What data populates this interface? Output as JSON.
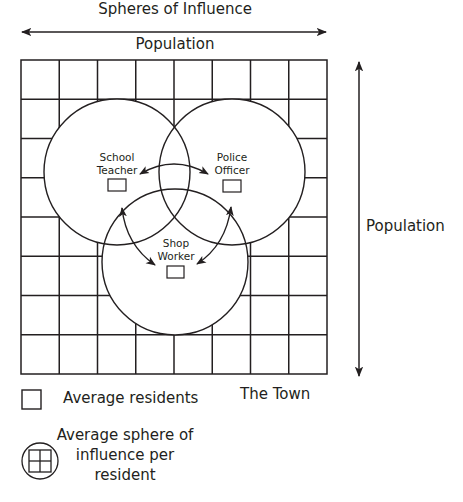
{
  "title": "Spheres of Influence",
  "axes": {
    "horizontal_label": "Population",
    "vertical_label": "Population"
  },
  "grid": {
    "columns": 8,
    "rows": 8,
    "label": "The Town"
  },
  "residents": [
    {
      "id": "teacher",
      "line1": "School",
      "line2": "Teacher"
    },
    {
      "id": "police",
      "line1": "Police",
      "line2": "Officer"
    },
    {
      "id": "shop",
      "line1": "Shop",
      "line2": "Worker"
    }
  ],
  "legend": {
    "square_label": "Average residents",
    "sphere_label_lines": [
      "Average sphere of",
      "influence per",
      "resident"
    ]
  },
  "colors": {
    "stroke": "#231f20",
    "background": "#ffffff"
  }
}
